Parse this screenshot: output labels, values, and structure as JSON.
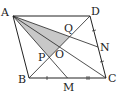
{
  "diagram": {
    "type": "geometry-parallelogram",
    "points": {
      "A": {
        "label": "A",
        "x": 13,
        "y": 16
      },
      "D": {
        "label": "D",
        "x": 90,
        "y": 16
      },
      "B": {
        "label": "B",
        "x": 29,
        "y": 78
      },
      "C": {
        "label": "C",
        "x": 106,
        "y": 78
      },
      "M": {
        "label": "M",
        "x": 67.5,
        "y": 78
      },
      "N": {
        "label": "N",
        "x": 98,
        "y": 47
      },
      "O": {
        "label": "O",
        "x": 59.5,
        "y": 47
      },
      "P": {
        "label": "P",
        "x": 49.3,
        "y": 57.3
      },
      "Q": {
        "label": "Q",
        "x": 69.7,
        "y": 36.7
      }
    },
    "shaded_region": [
      "A",
      "P",
      "Q"
    ],
    "shade_color": "#c8c8c8",
    "line_color": "#222222",
    "equal_marks": [
      "BM = MC",
      "DN = NC"
    ]
  }
}
